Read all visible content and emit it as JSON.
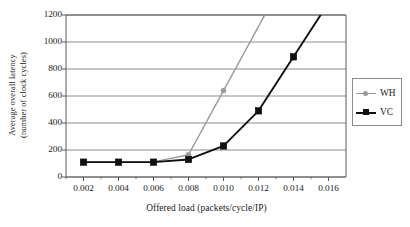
{
  "chart_data": {
    "type": "line",
    "title": "",
    "xlabel": "Offered load (packets/cycle/IP)",
    "ylabel_line1": "Average overall latency",
    "ylabel_line2": "(number of clock cycles)",
    "x": [
      0.002,
      0.004,
      0.006,
      0.008,
      0.01,
      0.012,
      0.014
    ],
    "xlim": [
      0.001,
      0.017
    ],
    "ylim": [
      0,
      1200
    ],
    "xticks": [
      "0.002",
      "0.004",
      "0.006",
      "0.008",
      "0.010",
      "0.012",
      "0.014",
      "0.016"
    ],
    "xtick_values": [
      0.002,
      0.004,
      0.006,
      0.008,
      0.01,
      0.012,
      0.014,
      0.016
    ],
    "yticks": [
      "0",
      "200",
      "400",
      "600",
      "800",
      "1000",
      "1200"
    ],
    "ytick_values": [
      0,
      200,
      400,
      600,
      800,
      1000,
      1200
    ],
    "grid": "horizontal",
    "legend_position": "right-outside",
    "series": [
      {
        "name": "WH",
        "color": "#9a9a9a",
        "marker": "circle",
        "x": [
          0.002,
          0.004,
          0.006,
          0.008,
          0.01
        ],
        "values": [
          110,
          110,
          112,
          165,
          640
        ],
        "clipped_continues_above": true,
        "clip_x": 0.0105
      },
      {
        "name": "VC",
        "color": "#101010",
        "marker": "square",
        "x": [
          0.002,
          0.004,
          0.006,
          0.008,
          0.01,
          0.012,
          0.014
        ],
        "values": [
          110,
          110,
          110,
          130,
          230,
          490,
          890
        ],
        "clipped_continues_above": true,
        "clip_x": 0.01455
      }
    ]
  },
  "legend": {
    "entries": [
      {
        "label": "WH"
      },
      {
        "label": "VC"
      }
    ]
  },
  "axes": {
    "x_title": "Offered load (packets/cycle/IP)",
    "y_title_line1": "Average overall latency",
    "y_title_line2": "(number of clock cycles)"
  },
  "colors": {
    "wh_series": "#9a9a9a",
    "vc_series": "#101010",
    "grid": "#8c8c8c",
    "frame": "#5a5a5a",
    "background": "#ffffff"
  }
}
